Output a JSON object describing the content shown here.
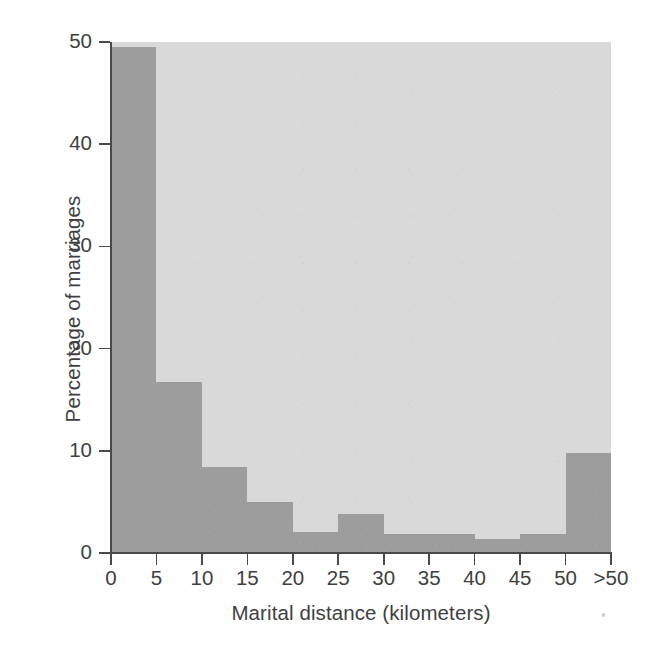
{
  "chart_data": {
    "type": "bar",
    "title": "",
    "xlabel": "Marital distance (kilometers)",
    "ylabel": "Percentage of marriages",
    "categories": [
      "0–5",
      "5–10",
      "10–15",
      "15–20",
      "20–25",
      "25–30",
      "30–35",
      "35–40",
      "40–45",
      "45–50",
      ">50"
    ],
    "values": [
      49.5,
      16.7,
      8.4,
      5.0,
      2.1,
      3.8,
      1.9,
      1.9,
      1.4,
      1.9,
      9.8
    ],
    "bin_edges": [
      0,
      5,
      10,
      15,
      20,
      25,
      30,
      35,
      40,
      45,
      50,
      55
    ],
    "xtick_labels": [
      "0",
      "5",
      "10",
      "15",
      "20",
      "25",
      "30",
      "35",
      "40",
      "45",
      "50",
      ">50"
    ],
    "ytick_labels": [
      "0",
      "10",
      "20",
      "30",
      "40",
      "50"
    ],
    "ytick_values": [
      0,
      10,
      20,
      30,
      40,
      50
    ],
    "xlim": [
      0,
      55
    ],
    "ylim": [
      0,
      50
    ],
    "grid": false,
    "legend": null,
    "colors": {
      "bar": "#9d9d9d",
      "panel_background": "#d9d9d9",
      "axis": "#4a4a4a",
      "text": "#3f3f3f",
      "figure_background": "#ffffff"
    }
  }
}
